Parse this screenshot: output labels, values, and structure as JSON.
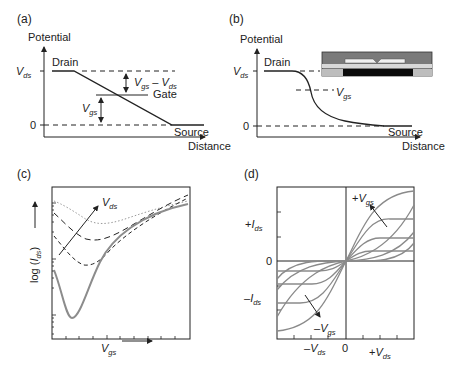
{
  "panels": {
    "a": {
      "label": "(a)",
      "ylabel": "Potential",
      "xlabel": "Distance",
      "y_ticks": [
        {
          "main": "V",
          "sub": "ds"
        },
        {
          "main": "0",
          "sub": ""
        }
      ],
      "annotations": {
        "drain": "Drain",
        "gate": "Gate",
        "source": "Source",
        "vgs_minus_vds": {
          "a": "V",
          "a_sub": "gs",
          "op": " – ",
          "b": "V",
          "b_sub": "ds"
        },
        "vgs": {
          "main": "V",
          "sub": "gs"
        }
      }
    },
    "b": {
      "label": "(b)",
      "ylabel": "Potential",
      "xlabel": "Distance",
      "y_ticks": [
        {
          "main": "V",
          "sub": "ds"
        },
        {
          "main": "0",
          "sub": ""
        }
      ],
      "annotations": {
        "drain": "Drain",
        "source": "Source",
        "vgs": {
          "main": "V",
          "sub": "gs"
        }
      },
      "inset": "device-cross-section"
    },
    "c": {
      "label": "(c)",
      "ylabel": {
        "pre": "log (",
        "main": "I",
        "sub": "ds",
        "post": ")"
      },
      "xlabel": {
        "main": "V",
        "sub": "gs"
      },
      "arrow_label": {
        "main": "V",
        "sub": "ds"
      }
    },
    "d": {
      "label": "(d)",
      "y_ticks": [
        {
          "pre": "+",
          "main": "I",
          "sub": "ds"
        },
        {
          "pre": "",
          "main": "0",
          "sub": ""
        },
        {
          "pre": "–",
          "main": "I",
          "sub": "ds"
        }
      ],
      "x_ticks": [
        {
          "pre": "–",
          "main": "V",
          "sub": "ds"
        },
        {
          "pre": "",
          "main": "0",
          "sub": ""
        },
        {
          "pre": "+",
          "main": "V",
          "sub": "ds"
        }
      ],
      "arrow_pos": {
        "pre": "+",
        "main": "V",
        "sub": "gs"
      },
      "arrow_neg": {
        "pre": "–",
        "main": "V",
        "sub": "gs"
      }
    }
  },
  "colors": {
    "line": "#222222",
    "gray_curve": "#8c8c8c",
    "dotted": "#9a9a9a"
  }
}
